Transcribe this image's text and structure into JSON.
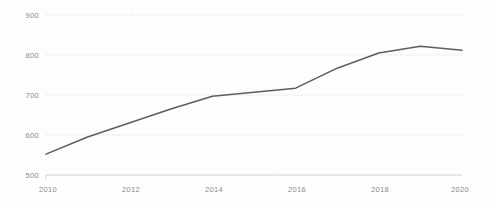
{
  "chart_data": {
    "type": "line",
    "title": "",
    "subtitle": "",
    "xlabel": "",
    "ylabel": "",
    "x": [
      2010,
      2011,
      2012,
      2013,
      2014,
      2015,
      2016,
      2017,
      2018,
      2019,
      2020
    ],
    "series": [
      {
        "name": "series-1",
        "values": [
          552,
          595,
          630,
          665,
          697,
          707,
          717,
          767,
          805,
          822,
          812
        ],
        "color": "#5d5d5d"
      }
    ],
    "xlim": [
      2010,
      2020
    ],
    "ylim": [
      500,
      900
    ],
    "x_ticks": [
      2010,
      2012,
      2014,
      2016,
      2018,
      2020
    ],
    "x_tick_labels": [
      "2010",
      "2012",
      "2014",
      "2016",
      "2018",
      "2020"
    ],
    "y_ticks": [
      500,
      600,
      700,
      800,
      900
    ],
    "y_tick_labels": [
      "500",
      "600",
      "700",
      "800",
      "900"
    ],
    "grid": {
      "horizontal": true,
      "vertical": false,
      "style": "dotted",
      "color": "#c8d4e4"
    },
    "legend": {
      "visible": false,
      "position": "none",
      "entries": []
    },
    "annotations": [],
    "background_color": "#fdfdfd",
    "axis_color": "#bdbdbd",
    "tick_label_color": "#8a8a8a"
  }
}
